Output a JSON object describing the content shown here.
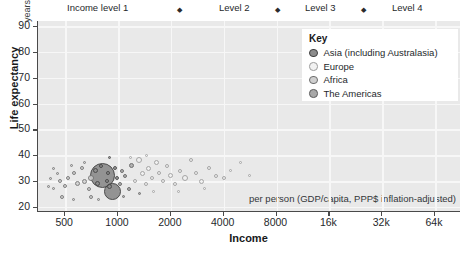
{
  "header": {
    "levels": [
      "Income level 1",
      "Level 2",
      "Level 3",
      "Level 4"
    ],
    "separator_icon": "diamond-marker"
  },
  "key": {
    "title": "Key",
    "entries": [
      {
        "label": "Asia (including Australasia)",
        "fill": "#8c8c8c",
        "stroke": "#3f3f3f"
      },
      {
        "label": "Europe",
        "fill": "#f2f2f2",
        "stroke": "#9a9a9a"
      },
      {
        "label": "Africa",
        "fill": "#cfcfcf",
        "stroke": "#6e6e6e"
      },
      {
        "label": "The Americas",
        "fill": "#a8a8a8",
        "stroke": "#5c5c5c"
      }
    ]
  },
  "chart_data": {
    "type": "scatter",
    "title": "",
    "xlabel": "Income",
    "ylabel": "Life expectancy",
    "y_unit": "years",
    "x_note": "per person (GDP/capita, PPP$ inflation-adjusted)",
    "x_scale": "log2",
    "xlim": [
      350,
      90000
    ],
    "ylim": [
      18,
      92
    ],
    "grid": true,
    "legend_position": "top-right-inside",
    "xticks": [
      {
        "value": 500,
        "label": "500"
      },
      {
        "value": 1000,
        "label": "1000"
      },
      {
        "value": 2000,
        "label": "2000"
      },
      {
        "value": 4000,
        "label": "4000"
      },
      {
        "value": 8000,
        "label": "8000"
      },
      {
        "value": 16000,
        "label": "16k"
      },
      {
        "value": 32000,
        "label": "32k"
      },
      {
        "value": 64000,
        "label": "64k"
      }
    ],
    "yticks": [
      {
        "value": 20,
        "label": "20"
      },
      {
        "value": 30,
        "label": "30"
      },
      {
        "value": 40,
        "label": "40"
      },
      {
        "value": 50,
        "label": "50"
      },
      {
        "value": 60,
        "label": "60"
      },
      {
        "value": 70,
        "label": "70"
      },
      {
        "value": 80,
        "label": "80"
      },
      {
        "value": 90,
        "label": "90"
      }
    ],
    "income_level_boundaries": [
      1000,
      4000,
      16000
    ],
    "points": [
      {
        "income": 820,
        "life": 32,
        "size": 25,
        "region": 0
      },
      {
        "income": 930,
        "life": 26,
        "size": 17,
        "region": 0
      },
      {
        "income": 700,
        "life": 31,
        "size": 6,
        "region": 2
      },
      {
        "income": 640,
        "life": 30,
        "size": 5,
        "region": 2
      },
      {
        "income": 590,
        "life": 29,
        "size": 5,
        "region": 2
      },
      {
        "income": 560,
        "life": 33,
        "size": 4,
        "region": 2
      },
      {
        "income": 520,
        "life": 31,
        "size": 4,
        "region": 2
      },
      {
        "income": 500,
        "life": 28,
        "size": 4,
        "region": 2
      },
      {
        "income": 470,
        "life": 30,
        "size": 4,
        "region": 2
      },
      {
        "income": 450,
        "life": 33,
        "size": 3,
        "region": 2
      },
      {
        "income": 430,
        "life": 27,
        "size": 3,
        "region": 2
      },
      {
        "income": 410,
        "life": 31,
        "size": 3,
        "region": 2
      },
      {
        "income": 620,
        "life": 35,
        "size": 4,
        "region": 2
      },
      {
        "income": 680,
        "life": 27,
        "size": 4,
        "region": 2
      },
      {
        "income": 740,
        "life": 34,
        "size": 5,
        "region": 0
      },
      {
        "income": 760,
        "life": 29,
        "size": 5,
        "region": 0
      },
      {
        "income": 800,
        "life": 36,
        "size": 4,
        "region": 0
      },
      {
        "income": 860,
        "life": 30,
        "size": 4,
        "region": 0
      },
      {
        "income": 880,
        "life": 33,
        "size": 4,
        "region": 0
      },
      {
        "income": 900,
        "life": 28,
        "size": 5,
        "region": 0
      },
      {
        "income": 960,
        "life": 35,
        "size": 4,
        "region": 0
      },
      {
        "income": 990,
        "life": 31,
        "size": 4,
        "region": 0
      },
      {
        "income": 1020,
        "life": 29,
        "size": 4,
        "region": 3
      },
      {
        "income": 1060,
        "life": 34,
        "size": 4,
        "region": 3
      },
      {
        "income": 1100,
        "life": 32,
        "size": 4,
        "region": 3
      },
      {
        "income": 1150,
        "life": 27,
        "size": 4,
        "region": 3
      },
      {
        "income": 1200,
        "life": 36,
        "size": 5,
        "region": 3
      },
      {
        "income": 1250,
        "life": 30,
        "size": 4,
        "region": 1
      },
      {
        "income": 1320,
        "life": 38,
        "size": 6,
        "region": 1
      },
      {
        "income": 1380,
        "life": 33,
        "size": 5,
        "region": 1
      },
      {
        "income": 1440,
        "life": 29,
        "size": 4,
        "region": 1
      },
      {
        "income": 1500,
        "life": 35,
        "size": 5,
        "region": 1
      },
      {
        "income": 1570,
        "life": 31,
        "size": 4,
        "region": 1
      },
      {
        "income": 1650,
        "life": 37,
        "size": 5,
        "region": 1
      },
      {
        "income": 1720,
        "life": 33,
        "size": 4,
        "region": 1
      },
      {
        "income": 1800,
        "life": 30,
        "size": 4,
        "region": 1
      },
      {
        "income": 1900,
        "life": 36,
        "size": 4,
        "region": 1
      },
      {
        "income": 2000,
        "life": 32,
        "size": 5,
        "region": 1
      },
      {
        "income": 2100,
        "life": 29,
        "size": 4,
        "region": 1
      },
      {
        "income": 2250,
        "life": 34,
        "size": 4,
        "region": 1
      },
      {
        "income": 2400,
        "life": 31,
        "size": 6,
        "region": 1
      },
      {
        "income": 2600,
        "life": 38,
        "size": 4,
        "region": 1
      },
      {
        "income": 2800,
        "life": 33,
        "size": 4,
        "region": 1
      },
      {
        "income": 3000,
        "life": 30,
        "size": 5,
        "region": 1
      },
      {
        "income": 3300,
        "life": 35,
        "size": 4,
        "region": 1
      },
      {
        "income": 3600,
        "life": 32,
        "size": 4,
        "region": 1
      },
      {
        "income": 4000,
        "life": 31,
        "size": 4,
        "region": 1
      },
      {
        "income": 4400,
        "life": 34,
        "size": 3,
        "region": 1
      },
      {
        "income": 5000,
        "life": 37,
        "size": 3,
        "region": 1
      },
      {
        "income": 5600,
        "life": 32,
        "size": 3,
        "region": 1
      },
      {
        "income": 480,
        "life": 24,
        "size": 4,
        "region": 2
      },
      {
        "income": 560,
        "life": 23,
        "size": 3,
        "region": 2
      },
      {
        "income": 700,
        "life": 24,
        "size": 4,
        "region": 2
      },
      {
        "income": 640,
        "life": 37,
        "size": 3,
        "region": 2
      },
      {
        "income": 540,
        "life": 36,
        "size": 3,
        "region": 2
      },
      {
        "income": 1080,
        "life": 24,
        "size": 3,
        "region": 3
      },
      {
        "income": 1320,
        "life": 25,
        "size": 3,
        "region": 3
      },
      {
        "income": 1600,
        "life": 26,
        "size": 3,
        "region": 1
      },
      {
        "income": 2200,
        "life": 26,
        "size": 3,
        "region": 1
      },
      {
        "income": 3100,
        "life": 27,
        "size": 3,
        "region": 1
      },
      {
        "income": 1450,
        "life": 40,
        "size": 3,
        "region": 1
      },
      {
        "income": 1180,
        "life": 39,
        "size": 3,
        "region": 1
      },
      {
        "income": 900,
        "life": 39,
        "size": 3,
        "region": 0
      },
      {
        "income": 770,
        "life": 23,
        "size": 3,
        "region": 2
      },
      {
        "income": 430,
        "life": 35,
        "size": 3,
        "region": 2
      },
      {
        "income": 400,
        "life": 28,
        "size": 3,
        "region": 2
      }
    ]
  }
}
